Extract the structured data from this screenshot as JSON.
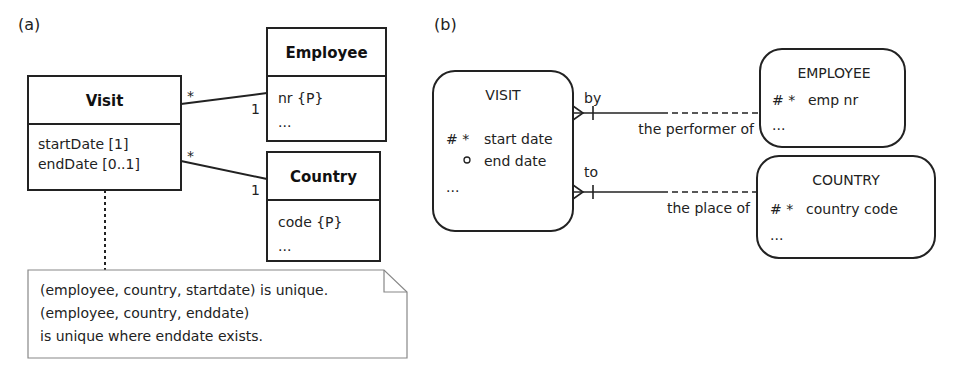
{
  "panel_a": {
    "label": "(a)",
    "visit": {
      "name": "Visit",
      "attrs": [
        "startDate [1]",
        "endDate [0..1]"
      ]
    },
    "employee": {
      "name": "Employee",
      "attrs": [
        "nr {P}",
        "..."
      ]
    },
    "country": {
      "name": "Country",
      "attrs": [
        "code {P}",
        "..."
      ]
    },
    "assoc_employee": {
      "visit_mult": "*",
      "employee_mult": "1"
    },
    "assoc_country": {
      "visit_mult": "*",
      "country_mult": "1"
    },
    "note": {
      "lines": [
        "(employee, country, startdate) is unique.",
        "(employee, country, enddate)",
        "is unique where enddate exists."
      ]
    }
  },
  "panel_b": {
    "label": "(b)",
    "visit": {
      "name": "VISIT",
      "attrs": [
        {
          "marker": "# *",
          "name": "start date"
        },
        {
          "marker": "o",
          "name": "end date"
        },
        {
          "marker": "",
          "name": "..."
        }
      ]
    },
    "employee": {
      "name": "EMPLOYEE",
      "attrs": [
        {
          "marker": "# *",
          "name": "emp nr"
        },
        {
          "marker": "",
          "name": "..."
        }
      ]
    },
    "country": {
      "name": "COUNTRY",
      "attrs": [
        {
          "marker": "# *",
          "name": "country code"
        },
        {
          "marker": "",
          "name": "..."
        }
      ]
    },
    "rel_employee": {
      "from_label": "by",
      "to_label": "the performer of"
    },
    "rel_country": {
      "from_label": "to",
      "to_label": "the place of"
    }
  }
}
